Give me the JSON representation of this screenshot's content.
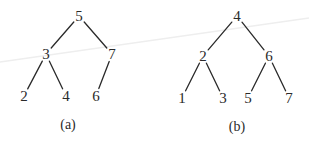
{
  "diagram": {
    "type": "binary-search-trees",
    "trees": [
      {
        "caption": "(a)",
        "nodes": [
          {
            "id": "a5",
            "label": "5",
            "x": 79,
            "y": 16
          },
          {
            "id": "a3",
            "label": "3",
            "x": 46,
            "y": 54
          },
          {
            "id": "a7",
            "label": "7",
            "x": 112,
            "y": 54
          },
          {
            "id": "a2",
            "label": "2",
            "x": 24,
            "y": 96
          },
          {
            "id": "a4",
            "label": "4",
            "x": 66,
            "y": 96
          },
          {
            "id": "a6",
            "label": "6",
            "x": 96,
            "y": 96
          }
        ],
        "edges": [
          {
            "from": "a5",
            "to": "a3"
          },
          {
            "from": "a5",
            "to": "a7"
          },
          {
            "from": "a3",
            "to": "a2"
          },
          {
            "from": "a3",
            "to": "a4"
          },
          {
            "from": "a7",
            "to": "a6"
          }
        ],
        "caption_pos": {
          "x": 68,
          "y": 124
        }
      },
      {
        "caption": "(b)",
        "nodes": [
          {
            "id": "b4",
            "label": "4",
            "x": 237,
            "y": 16
          },
          {
            "id": "b2",
            "label": "2",
            "x": 203,
            "y": 56
          },
          {
            "id": "b6",
            "label": "6",
            "x": 269,
            "y": 56
          },
          {
            "id": "b1",
            "label": "1",
            "x": 182,
            "y": 98
          },
          {
            "id": "b3",
            "label": "3",
            "x": 223,
            "y": 98
          },
          {
            "id": "b5",
            "label": "5",
            "x": 248,
            "y": 98
          },
          {
            "id": "b7",
            "label": "7",
            "x": 289,
            "y": 98
          }
        ],
        "edges": [
          {
            "from": "b4",
            "to": "b2"
          },
          {
            "from": "b4",
            "to": "b6"
          },
          {
            "from": "b2",
            "to": "b1"
          },
          {
            "from": "b2",
            "to": "b3"
          },
          {
            "from": "b6",
            "to": "b5"
          },
          {
            "from": "b6",
            "to": "b7"
          }
        ],
        "caption_pos": {
          "x": 237,
          "y": 126
        }
      }
    ]
  }
}
